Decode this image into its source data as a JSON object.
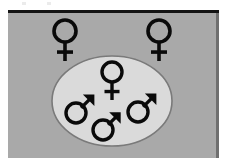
{
  "figure": {
    "canvas": {
      "width": 226,
      "height": 167
    },
    "colors": {
      "page_background": "#ffffff",
      "panel_background": "#a9a9a9",
      "ellipse_fill": "#dadada",
      "ellipse_stroke": "#7a7a7a",
      "symbol_stroke": "#0a0a0a",
      "top_border": "#141414",
      "panel_edge": "#6f6f6f"
    },
    "panel": {
      "x": 8,
      "y": 10,
      "width": 211,
      "height": 148,
      "top_border_thickness": 3,
      "label": "panel-background"
    },
    "ellipse": {
      "cx": 112,
      "cy": 101,
      "rx": 60,
      "ry": 45,
      "stroke_width": 1.6,
      "label": "group-boundary-ellipse"
    },
    "symbols": [
      {
        "id": "female-outside-left",
        "type": "female",
        "glyph": "♀",
        "cx": 65,
        "cy": 31,
        "circle_radius": 11,
        "stem_length": 19,
        "crossbar_width": 16,
        "stroke_width": 3.6,
        "inside_group": false
      },
      {
        "id": "female-outside-right",
        "type": "female",
        "glyph": "♀",
        "cx": 159,
        "cy": 31,
        "circle_radius": 11,
        "stem_length": 19,
        "crossbar_width": 16,
        "stroke_width": 3.6,
        "inside_group": false
      },
      {
        "id": "female-inside-center",
        "type": "female",
        "glyph": "♀",
        "cx": 112,
        "cy": 72,
        "circle_radius": 10,
        "stem_length": 18,
        "crossbar_width": 15,
        "stroke_width": 3.4,
        "inside_group": true
      },
      {
        "id": "male-inside-left",
        "type": "male",
        "glyph": "♂",
        "cx": 76,
        "cy": 113,
        "circle_radius": 10,
        "arrow_angle_deg": -45,
        "arrow_length": 26,
        "stroke_width": 3.4,
        "inside_group": true
      },
      {
        "id": "male-inside-bottom",
        "type": "male",
        "glyph": "♂",
        "cx": 103,
        "cy": 130,
        "circle_radius": 10,
        "arrow_angle_deg": -45,
        "arrow_length": 25,
        "stroke_width": 3.4,
        "inside_group": true
      },
      {
        "id": "male-inside-right",
        "type": "male",
        "glyph": "♂",
        "cx": 138,
        "cy": 112,
        "circle_radius": 10,
        "arrow_angle_deg": -45,
        "arrow_length": 26,
        "stroke_width": 3.4,
        "inside_group": true
      }
    ],
    "counts": {
      "females_outside": 2,
      "females_inside": 1,
      "males_inside": 3,
      "total_symbols": 6
    }
  }
}
